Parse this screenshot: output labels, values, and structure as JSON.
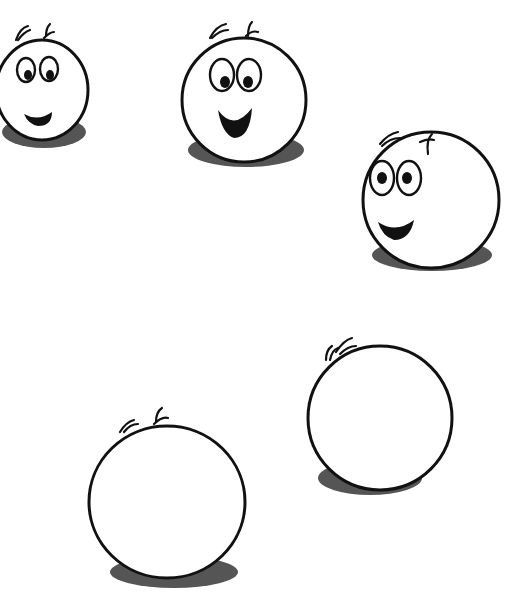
{
  "scene": {
    "description": "Five round cartoon head outlines on a white background; three show happy faces, two are blank",
    "background": "#ffffff",
    "outline_color": "#111111",
    "shadow_color": "#555555"
  },
  "faces": [
    {
      "id": "face-1",
      "expression": "smiling",
      "has_face": true,
      "cx": 42,
      "cy": 92,
      "r": 46,
      "clipped_left": true
    },
    {
      "id": "face-2",
      "expression": "open-mouth smile",
      "has_face": true,
      "cx": 244,
      "cy": 100,
      "r": 62
    },
    {
      "id": "face-3",
      "expression": "smiling",
      "has_face": true,
      "cx": 431,
      "cy": 200,
      "r": 68
    },
    {
      "id": "face-4",
      "expression": "blank",
      "has_face": false,
      "cx": 380,
      "cy": 418,
      "r": 72
    },
    {
      "id": "face-5",
      "expression": "blank",
      "has_face": false,
      "cx": 167,
      "cy": 502,
      "r": 78
    }
  ]
}
